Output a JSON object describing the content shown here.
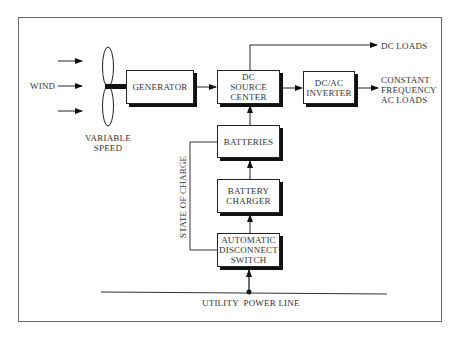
{
  "diagram": {
    "inputs": {
      "wind_label": "WIND",
      "rotor_label": "VARIABLE\nSPEED"
    },
    "blocks": {
      "generator": "GENERATOR",
      "dc_source_center": "DC\nSOURCE\nCENTER",
      "inverter": "DC/AC\nINVERTER",
      "batteries": "BATTERIES",
      "battery_charger": "BATTERY\nCHARGER",
      "disconnect_switch": "AUTOMATIC\nDISCONNECT\nSWITCH"
    },
    "outputs": {
      "dc_loads": "DC LOADS",
      "ac_loads": "CONSTANT\nFREQUENCY\nAC LOADS"
    },
    "signals": {
      "state_of_charge": "STATE OF CHARGE",
      "utility_line": "UTILITY  POWER LINE"
    },
    "colors": {
      "line": "#222222",
      "frame": "#6a6a6a",
      "text": "#333333"
    }
  }
}
